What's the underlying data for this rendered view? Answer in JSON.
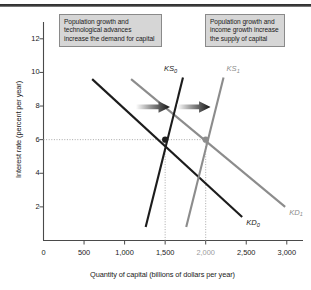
{
  "figure": {
    "top_rule": "horizontal-rule"
  },
  "callouts": [
    {
      "id": "demand-shift-note",
      "text": "Population growth and technological advances increase the demand for capital"
    },
    {
      "id": "supply-shift-note",
      "text": "Population growth and income growth increase the supply of capital"
    }
  ],
  "chart_data": {
    "type": "line",
    "title": "",
    "xlabel": "Quantity of capital (billions of dollars per year)",
    "ylabel": "Interest rate (percent per year)",
    "xlim": [
      0,
      3200
    ],
    "ylim": [
      0,
      13
    ],
    "grid": false,
    "x_ticks": [
      {
        "value": 0,
        "label": "0",
        "muted": false
      },
      {
        "value": 500,
        "label": "500",
        "muted": false
      },
      {
        "value": 1000,
        "label": "1,000",
        "muted": false
      },
      {
        "value": 1500,
        "label": "1,500",
        "muted": false
      },
      {
        "value": 2000,
        "label": "2,000",
        "muted": true
      },
      {
        "value": 2500,
        "label": "2,500",
        "muted": false
      },
      {
        "value": 3000,
        "label": "3,000",
        "muted": false
      }
    ],
    "y_ticks": [
      {
        "value": 2,
        "label": "2"
      },
      {
        "value": 4,
        "label": "4"
      },
      {
        "value": 6,
        "label": "6"
      },
      {
        "value": 8,
        "label": "8"
      },
      {
        "value": 10,
        "label": "10"
      },
      {
        "value": 12,
        "label": "12"
      }
    ],
    "series": [
      {
        "name": "KD0",
        "label": "KD",
        "subscript": "0",
        "kind": "demand",
        "color": "#1c1c1c",
        "points": [
          [
            600,
            9.6
          ],
          [
            2450,
            1.4
          ]
        ]
      },
      {
        "name": "KD1",
        "label": "KD",
        "subscript": "1",
        "kind": "demand",
        "color": "#8c8c8c",
        "points": [
          [
            1080,
            9.6
          ],
          [
            2980,
            2.0
          ]
        ]
      },
      {
        "name": "KS0",
        "label": "KS",
        "subscript": "0",
        "kind": "supply",
        "color": "#1c1c1c",
        "points": [
          [
            1260,
            0.8
          ],
          [
            1720,
            9.7
          ]
        ]
      },
      {
        "name": "KS1",
        "label": "KS",
        "subscript": "1",
        "kind": "supply",
        "color": "#8c8c8c",
        "points": [
          [
            1760,
            0.8
          ],
          [
            2220,
            9.7
          ]
        ]
      }
    ],
    "equilibria": [
      {
        "name": "initial-equilibrium",
        "x": 1500,
        "y": 6,
        "color": "#1c1c1c"
      },
      {
        "name": "new-equilibrium",
        "x": 2000,
        "y": 6,
        "color": "#8c8c8c"
      }
    ],
    "reference_lines": [
      {
        "name": "interest-rate-6-line",
        "orientation": "horizontal",
        "value": 6,
        "from": 0,
        "to": 2000
      },
      {
        "name": "quantity-1500-line",
        "orientation": "vertical",
        "value": 1500,
        "from": 0,
        "to": 6
      },
      {
        "name": "quantity-2000-line",
        "orientation": "vertical",
        "value": 2000,
        "from": 0,
        "to": 6
      }
    ],
    "annotations": [
      {
        "name": "demand-shift-arrow",
        "x1": 1140,
        "y1": 7.95,
        "x2": 1560,
        "y2": 7.95
      },
      {
        "name": "supply-shift-arrow",
        "x1": 1650,
        "y1": 7.95,
        "x2": 2060,
        "y2": 7.95
      }
    ]
  }
}
